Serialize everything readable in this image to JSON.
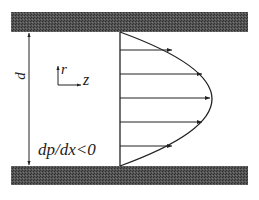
{
  "diagram": {
    "type": "poiseuille-flow-between-parallel-plates",
    "labels": {
      "gap": "d",
      "radial_axis": "r",
      "axial_axis": "z",
      "pressure_gradient": "dp/dx<0"
    },
    "plates": [
      {
        "name": "top-plate",
        "x": 11,
        "y": 12,
        "width": 237,
        "height": 20
      },
      {
        "name": "bottom-plate",
        "x": 11,
        "y": 166,
        "width": 237,
        "height": 19
      }
    ],
    "profile": {
      "base_x": 120,
      "top_y": 32,
      "bottom_y": 166,
      "apex_x": 212,
      "apex_y": 99,
      "arrows": [
        {
          "y": 50,
          "tip_x": 172
        },
        {
          "y": 74,
          "tip_x": 202
        },
        {
          "y": 98,
          "tip_x": 210
        },
        {
          "y": 122,
          "tip_x": 202
        },
        {
          "y": 146,
          "tip_x": 172
        }
      ]
    },
    "colors": {
      "plate_fill": "#4a4a4a",
      "line": "#222222",
      "background": "#ffffff"
    }
  }
}
